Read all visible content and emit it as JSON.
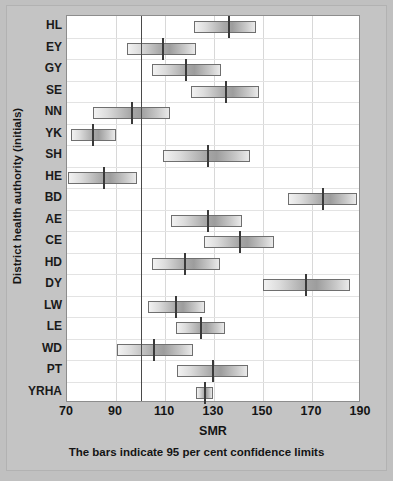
{
  "chart_data": {
    "type": "bar",
    "subtype": "horizontal-confidence-interval",
    "title": "",
    "xlabel": "SMR",
    "ylabel": "District health authority (initials)",
    "caption": "The bars indicate 95 per cent confidence limits",
    "xlim": [
      70,
      190
    ],
    "xticks": [
      70,
      90,
      110,
      130,
      150,
      170,
      190
    ],
    "xtick_labels": [
      "70",
      "90",
      "110",
      "130",
      "150",
      "170",
      "190"
    ],
    "grid": "both",
    "reference_line": 100,
    "legend": "none",
    "categories": [
      "HL",
      "EY",
      "GY",
      "SE",
      "NN",
      "YK",
      "SH",
      "HE",
      "BD",
      "AE",
      "CE",
      "HD",
      "DY",
      "LW",
      "LE",
      "WD",
      "PT",
      "YRHA"
    ],
    "points": [
      {
        "label": "HL",
        "value": 136.0,
        "low": 122.0,
        "high": 147.0
      },
      {
        "label": "EY",
        "value": 109.0,
        "low": 94.5,
        "high": 122.5
      },
      {
        "label": "GY",
        "value": 118.5,
        "low": 104.5,
        "high": 133.0
      },
      {
        "label": "SE",
        "value": 135.0,
        "low": 120.5,
        "high": 148.5
      },
      {
        "label": "NN",
        "value": 96.5,
        "low": 80.5,
        "high": 112.0
      },
      {
        "label": "YK",
        "value": 80.5,
        "low": 71.5,
        "high": 90.0
      },
      {
        "label": "SH",
        "value": 127.5,
        "low": 109.0,
        "high": 144.5
      },
      {
        "label": "HE",
        "value": 85.0,
        "low": 70.5,
        "high": 98.5
      },
      {
        "label": "BD",
        "value": 174.5,
        "low": 160.0,
        "high": 188.5
      },
      {
        "label": "AE",
        "value": 127.5,
        "low": 112.5,
        "high": 141.5
      },
      {
        "label": "CE",
        "value": 140.5,
        "low": 126.0,
        "high": 154.5
      },
      {
        "label": "HD",
        "value": 118.0,
        "low": 104.5,
        "high": 132.5
      },
      {
        "label": "DY",
        "value": 167.5,
        "low": 150.0,
        "high": 185.5
      },
      {
        "label": "LW",
        "value": 114.5,
        "low": 103.0,
        "high": 126.5
      },
      {
        "label": "LE",
        "value": 124.5,
        "low": 114.5,
        "high": 134.5
      },
      {
        "label": "WD",
        "value": 105.5,
        "low": 90.5,
        "high": 121.5
      },
      {
        "label": "PT",
        "value": 129.5,
        "low": 115.0,
        "high": 144.0
      },
      {
        "label": "YRHA",
        "value": 126.5,
        "low": 122.5,
        "high": 129.5
      }
    ]
  },
  "colors": {
    "figure_background": "#c0c0c0",
    "plot_background": "#ffffff",
    "bar_border": "#6f6f6f",
    "tick_marker": "#3a3a3a",
    "reference_line": "#4a4a4a",
    "grid": "#d8d8d8",
    "text": "#141414"
  }
}
